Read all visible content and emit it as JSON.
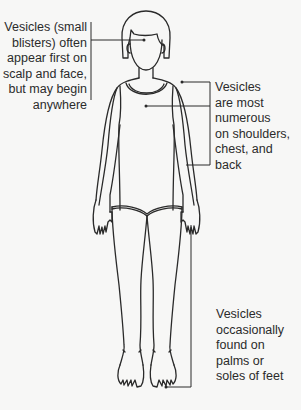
{
  "diagram": {
    "colors": {
      "background": "#f7f7f6",
      "line": "#2a2a2a",
      "text": "#2b2b2b"
    },
    "annotations": [
      {
        "id": "head",
        "lines": [
          "Vesicles (small",
          "blisters) often",
          "appear first on",
          "scalp and face,",
          "but may begin",
          "anywhere"
        ],
        "points_to": "face/scalp"
      },
      {
        "id": "trunk",
        "lines": [
          "Vesicles",
          "are most",
          "numerous",
          "on shoulders,",
          "chest, and",
          "back"
        ],
        "points_to": "shoulders, chest, back"
      },
      {
        "id": "extremities",
        "lines": [
          "Vesicles",
          "occasionally",
          "found on",
          "palms or",
          "soles of feet"
        ],
        "points_to": "palm and sole"
      }
    ]
  }
}
